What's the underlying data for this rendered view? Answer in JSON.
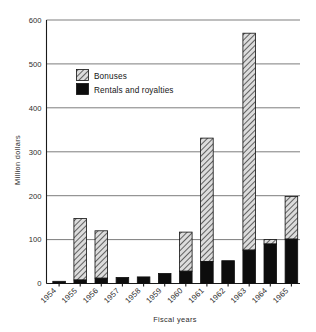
{
  "chart_data": {
    "type": "bar",
    "title": "",
    "subtitle": "",
    "xlabel": "Fiscal years",
    "ylabel": "Million dollars",
    "categories": [
      "1954",
      "1955",
      "1956",
      "1957",
      "1958",
      "1959",
      "1960",
      "1961",
      "1962",
      "1963",
      "1964",
      "1965"
    ],
    "series": [
      {
        "name": "Rentals and royalties",
        "values": [
          5,
          8,
          12,
          14,
          15,
          23,
          28,
          50,
          52,
          76,
          90,
          101
        ]
      },
      {
        "name": "Bonuses",
        "values": [
          0,
          140,
          108,
          0,
          0,
          0,
          89,
          281,
          0,
          494,
          10,
          97
        ]
      }
    ],
    "totals": [
      5,
      148,
      120,
      14,
      15,
      23,
      117,
      331,
      52,
      570,
      100,
      198
    ],
    "stacked": true,
    "ylim": [
      0,
      600
    ],
    "yticks": [
      0,
      100,
      200,
      300,
      400,
      500,
      600
    ],
    "ytick_labels": [
      "0",
      "100",
      "200",
      "300",
      "400",
      "500",
      "600"
    ],
    "grid": "horizontal",
    "legend_position": "inside-upper-left",
    "colors": {
      "bonuses_fill": "#d9d9d9",
      "bonuses_hatch": "#4d4d4d",
      "rentals_fill": "#0d0d0d",
      "outline": "#111111",
      "gridline": "#666666",
      "axis": "#1a1a1a",
      "background": "#ffffff",
      "text": "#1a1a1a"
    }
  },
  "legend": {
    "items": [
      {
        "label": "Bonuses",
        "swatch": "hatched"
      },
      {
        "label": "Rentals and royalties",
        "swatch": "solid-black"
      }
    ]
  },
  "axes": {
    "y_title": "Million dollars",
    "x_title": "Fiscal years"
  }
}
